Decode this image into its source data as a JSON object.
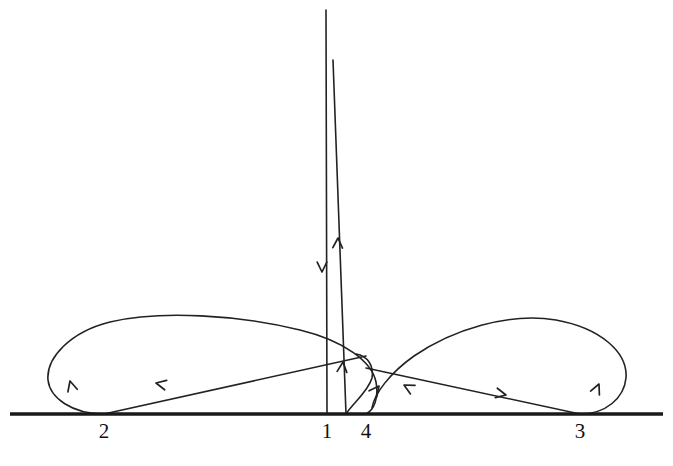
{
  "figure": {
    "type": "trajectory-diagram",
    "title": "",
    "background_color": "#ffffff",
    "stroke_color": "#222222",
    "axis_color": "#1a1a1a",
    "width": 673,
    "height": 466,
    "baseline_y": 414
  },
  "labels": [
    {
      "name": "point-label-2",
      "text": "2",
      "x": 104,
      "y": 421
    },
    {
      "name": "point-label-1",
      "text": "1",
      "x": 327,
      "y": 421
    },
    {
      "name": "point-label-4",
      "text": "4",
      "x": 366,
      "y": 421
    },
    {
      "name": "point-label-3",
      "text": "3",
      "x": 580,
      "y": 421
    }
  ],
  "points": [
    {
      "id": "2",
      "x": 104,
      "y": 414
    },
    {
      "id": "1",
      "x": 327,
      "y": 414
    },
    {
      "id": "4",
      "x": 366,
      "y": 414
    },
    {
      "id": "3",
      "x": 580,
      "y": 414
    }
  ],
  "chart_data": {
    "type": "line",
    "title": "",
    "xlabel": "",
    "ylabel": "",
    "grid": false,
    "legend": null,
    "axis": {
      "baseline_y": 414,
      "x_start": 10,
      "x_end": 663
    },
    "marked_points": [
      {
        "label": "2",
        "x": 104
      },
      {
        "label": "1",
        "x": 327
      },
      {
        "label": "4",
        "x": 366
      },
      {
        "label": "3",
        "x": 580
      }
    ],
    "segments": [
      {
        "name": "left-loop",
        "description": "large loop rising from point 2, arcing left and up then sweeping right across to near point 4",
        "path": "M 104 414 C 72 414 50 398 48 380 C 46 358 70 332 110 322 C 160 310 240 315 300 330 C 345 341 372 362 376 382 C 379 398 374 410 366 414"
      },
      {
        "name": "left-diagonal",
        "description": "straight descending line from upper right down-left to point 2",
        "path": "M 366 356 L 104 414"
      },
      {
        "name": "spike-left-edge",
        "description": "tall nearly vertical line descending from top down to point 1",
        "path": "M 326 10 L 327 414"
      },
      {
        "name": "spike-right-edge",
        "description": "tall nearly vertical line ascending from baseline near point 1 up to the top",
        "path": "M 346 414 L 333 60"
      },
      {
        "name": "inner-small-loop",
        "description": "small tight loop between point 1 and point 4 near the baseline",
        "path": "M 346 414 C 352 404 368 392 372 378 C 374 366 368 356 356 354"
      },
      {
        "name": "right-loop",
        "description": "large loop rising from point 3, arcing right and up then sweeping left back toward point 4",
        "path": "M 580 414 C 606 414 624 398 626 378 C 628 352 600 328 556 320 C 508 312 452 330 414 356 C 390 373 374 394 372 408"
      },
      {
        "name": "right-diagonal",
        "description": "straight descending line from upper left down-right to point 3",
        "path": "M 366 368 L 580 414"
      }
    ],
    "arrows": [
      {
        "name": "arrow-left-loop-up",
        "x": 70,
        "y": 381,
        "angle": -105,
        "direction": "up"
      },
      {
        "name": "arrow-left-diagonal-down",
        "x": 156,
        "y": 383,
        "angle": 192,
        "direction": "down-left"
      },
      {
        "name": "arrow-spike-down",
        "x": 322,
        "y": 272,
        "angle": 90,
        "direction": "down"
      },
      {
        "name": "arrow-spike-up",
        "x": 338,
        "y": 238,
        "angle": -88,
        "direction": "up"
      },
      {
        "name": "arrow-inner-loop-up",
        "x": 343,
        "y": 362,
        "angle": -84,
        "direction": "up"
      },
      {
        "name": "arrow-point4-up-right",
        "x": 379,
        "y": 386,
        "angle": -52,
        "direction": "up-right"
      },
      {
        "name": "arrow-point4-down-left",
        "x": 404,
        "y": 385,
        "angle": 208,
        "direction": "down-left"
      },
      {
        "name": "arrow-right-diagonal-down",
        "x": 506,
        "y": 395,
        "angle": 12,
        "direction": "down-right"
      },
      {
        "name": "arrow-right-loop-up",
        "x": 599,
        "y": 384,
        "angle": -66,
        "direction": "up-right"
      }
    ]
  }
}
